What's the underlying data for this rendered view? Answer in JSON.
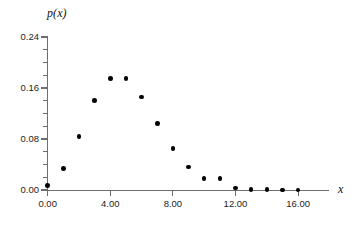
{
  "chart_data": {
    "type": "scatter",
    "title": "",
    "subtitle": "",
    "xlabel": "x",
    "ylabel": "p(x)",
    "x": [
      0,
      1,
      2,
      3,
      4,
      5,
      6,
      7,
      8,
      9,
      10,
      11,
      12,
      13,
      14,
      15,
      16
    ],
    "values": [
      0.007,
      0.034,
      0.084,
      0.14,
      0.175,
      0.175,
      0.146,
      0.104,
      0.065,
      0.036,
      0.018,
      0.018,
      0.003,
      0.001,
      0.001,
      0.0,
      0.0
    ],
    "series": [
      {
        "name": "p(x)",
        "values": [
          0.007,
          0.034,
          0.084,
          0.14,
          0.175,
          0.175,
          0.146,
          0.104,
          0.065,
          0.036,
          0.018,
          0.018,
          0.003,
          0.001,
          0.001,
          0.0,
          0.0
        ]
      }
    ],
    "xlim": [
      0,
      18
    ],
    "ylim": [
      0.0,
      0.24
    ],
    "xticks": [
      0,
      4,
      8,
      12,
      16
    ],
    "xtick_labels": [
      "0.00",
      "4.00",
      "8.00",
      "12.00",
      "16.00"
    ],
    "yticks": [
      0.0,
      0.08,
      0.16,
      0.24
    ],
    "ytick_labels": [
      "0.00",
      "0.08",
      "0.16",
      "0.24"
    ],
    "yminor_ticks": [
      0.02,
      0.04,
      0.06,
      0.1,
      0.12,
      0.14,
      0.18,
      0.2,
      0.22
    ],
    "grid": false,
    "legend": false,
    "legend_position": "none",
    "marker": "filled-circle",
    "marker_color": "#000000",
    "axis_color": "#6e6e6e",
    "background_color": "#ffffff"
  }
}
